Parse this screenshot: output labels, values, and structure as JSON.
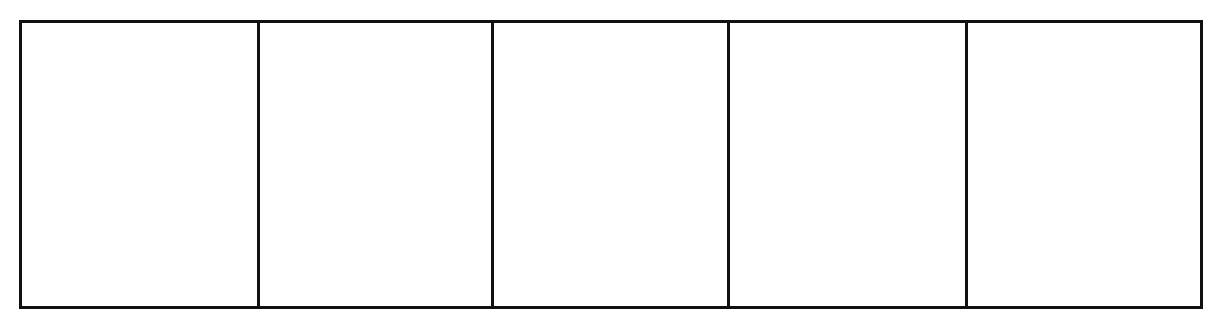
{
  "diagram": {
    "type": "empty-grid-strip",
    "rows": 1,
    "columns": 5,
    "cells": [
      {
        "label": ""
      },
      {
        "label": ""
      },
      {
        "label": ""
      },
      {
        "label": ""
      },
      {
        "label": ""
      }
    ],
    "colors": {
      "border": "#111111",
      "background": "#ffffff"
    }
  }
}
